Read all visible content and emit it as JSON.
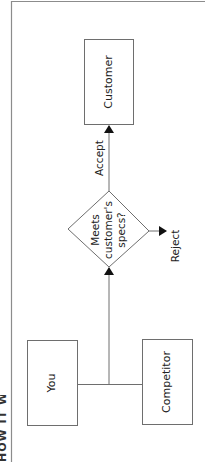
{
  "diagram": {
    "type": "flowchart",
    "orientation": "rotated-90-ccw",
    "frame": {
      "border_color": "#8c8c8c"
    },
    "cutoff_title": {
      "text": "HOW IT WORKS",
      "legible": false
    },
    "nodes": {
      "you": {
        "label": "You",
        "shape": "rectangle"
      },
      "competitor": {
        "label": "Competitor",
        "shape": "rectangle"
      },
      "decision": {
        "shape": "diamond",
        "lines": [
          "Meets",
          "customer's",
          "specs?"
        ]
      },
      "customer": {
        "label": "Customer",
        "shape": "rectangle"
      }
    },
    "edges": {
      "accept": {
        "from": "decision",
        "to": "customer",
        "label": "Accept"
      },
      "reject": {
        "from": "decision",
        "to": "outside",
        "label": "Reject"
      },
      "merge": {
        "from": [
          "you",
          "competitor"
        ],
        "to": "decision",
        "label": ""
      }
    },
    "colors": {
      "stroke": "#6e6e6e",
      "arrow": "#111111",
      "text": "#222222",
      "background": "#ffffff"
    }
  }
}
